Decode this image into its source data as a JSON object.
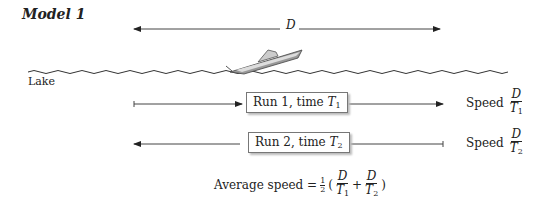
{
  "title": "Model 1",
  "distance_label": "D",
  "lake_label": "Lake",
  "runs": [
    {
      "label": "Run 1, time ",
      "var": "T",
      "sub": "1",
      "direction": "right"
    },
    {
      "label": "Run 2, time ",
      "var": "T",
      "sub": "2",
      "direction": "left"
    }
  ],
  "speeds": [
    {
      "label": "Speed",
      "num": "D",
      "den": "T",
      "sub": "1"
    },
    {
      "label": "Speed",
      "num": "D",
      "den": "T",
      "sub": "2"
    }
  ],
  "average": {
    "label": "Average speed =",
    "half_num": "1",
    "half_den": "2",
    "plus": "+",
    "open": "(",
    "close": ")",
    "terms": [
      {
        "num": "D",
        "den": "T",
        "sub": "1"
      },
      {
        "num": "D",
        "den": "T",
        "sub": "2"
      }
    ]
  }
}
